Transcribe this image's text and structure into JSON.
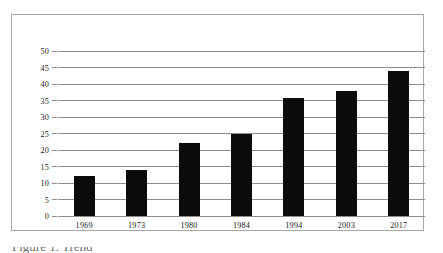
{
  "figure": {
    "frame_color": "#a8a8a8",
    "background": "#ffffff",
    "caption_partial": "Figure 1. Trend"
  },
  "chart_data": {
    "type": "bar",
    "title": "",
    "subtitle": "",
    "xlabel": "",
    "ylabel": "",
    "categories": [
      "1969",
      "1973",
      "1980",
      "1984",
      "1994",
      "2003",
      "2017"
    ],
    "values": [
      12,
      14,
      22,
      24.8,
      35.7,
      37.8,
      44
    ],
    "series": [
      {
        "name": "",
        "values": [
          12,
          14,
          22,
          24.8,
          35.7,
          37.8,
          44
        ],
        "color": "#0b0b0b"
      }
    ],
    "ylim": [
      0,
      50
    ],
    "ytick_labels": [
      "0",
      "5",
      "10",
      "15",
      "20",
      "25",
      "30",
      "35",
      "40",
      "45",
      "50"
    ],
    "ytick_values": [
      0,
      5,
      10,
      15,
      20,
      25,
      30,
      35,
      40,
      45,
      50
    ],
    "xtick_labels": [
      "1969",
      "1973",
      "1980",
      "1984",
      "1994",
      "2003",
      "2017"
    ],
    "grid": true,
    "grid_axis": "y",
    "grid_color": "#8d8d8d",
    "legend": false,
    "legend_position": "none",
    "bar_color": "#0b0b0b",
    "annotations": []
  }
}
